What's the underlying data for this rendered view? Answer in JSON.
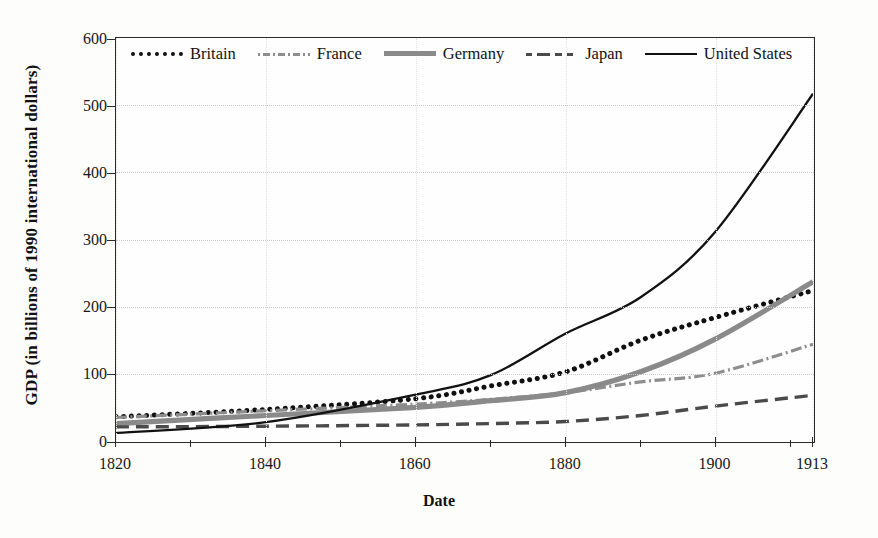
{
  "chart_data": {
    "type": "line",
    "title": "",
    "xlabel": "Date",
    "ylabel": "GDP (in billions of 1990 international dollars)",
    "x": [
      1820,
      1840,
      1860,
      1870,
      1880,
      1890,
      1900,
      1913
    ],
    "xtick_labels": [
      "1820",
      "1840",
      "1860",
      "1880",
      "1900",
      "1913"
    ],
    "xtick_values": [
      1820,
      1840,
      1860,
      1880,
      1900,
      1913
    ],
    "ytick_labels": [
      "0",
      "100",
      "200",
      "300",
      "400",
      "500",
      "600"
    ],
    "ytick_values": [
      0,
      100,
      200,
      300,
      400,
      500,
      600
    ],
    "xlim": [
      1820,
      1913
    ],
    "ylim": [
      0,
      600
    ],
    "grid": true,
    "legend_position": "top-inside",
    "series": [
      {
        "name": "Britain",
        "style": "dotted",
        "color": "#101010",
        "values": [
          36,
          47,
          63,
          82,
          103,
          150,
          184,
          224
        ]
      },
      {
        "name": "France",
        "style": "dash-dot",
        "color": "#8d8d8d",
        "values": [
          35,
          45,
          55,
          62,
          72,
          88,
          101,
          144
        ]
      },
      {
        "name": "Germany",
        "style": "solid-thick-gray",
        "color": "#8a8a8a",
        "values": [
          26,
          38,
          50,
          60,
          72,
          103,
          152,
          237
        ]
      },
      {
        "name": "Japan",
        "style": "dashed",
        "color": "#4a4a4a",
        "values": [
          21,
          22,
          24,
          26,
          29,
          38,
          52,
          68
        ]
      },
      {
        "name": "United States",
        "style": "solid-thin-black",
        "color": "#111111",
        "values": [
          12,
          28,
          69,
          98,
          160,
          214,
          312,
          517
        ]
      }
    ]
  },
  "axes": {
    "y_title": "GDP (in billions of 1990 international dollars)",
    "x_title": "Date"
  },
  "legend": {
    "items": [
      {
        "label": "Britain"
      },
      {
        "label": "France"
      },
      {
        "label": "Germany"
      },
      {
        "label": "Japan"
      },
      {
        "label": "United States"
      }
    ]
  }
}
